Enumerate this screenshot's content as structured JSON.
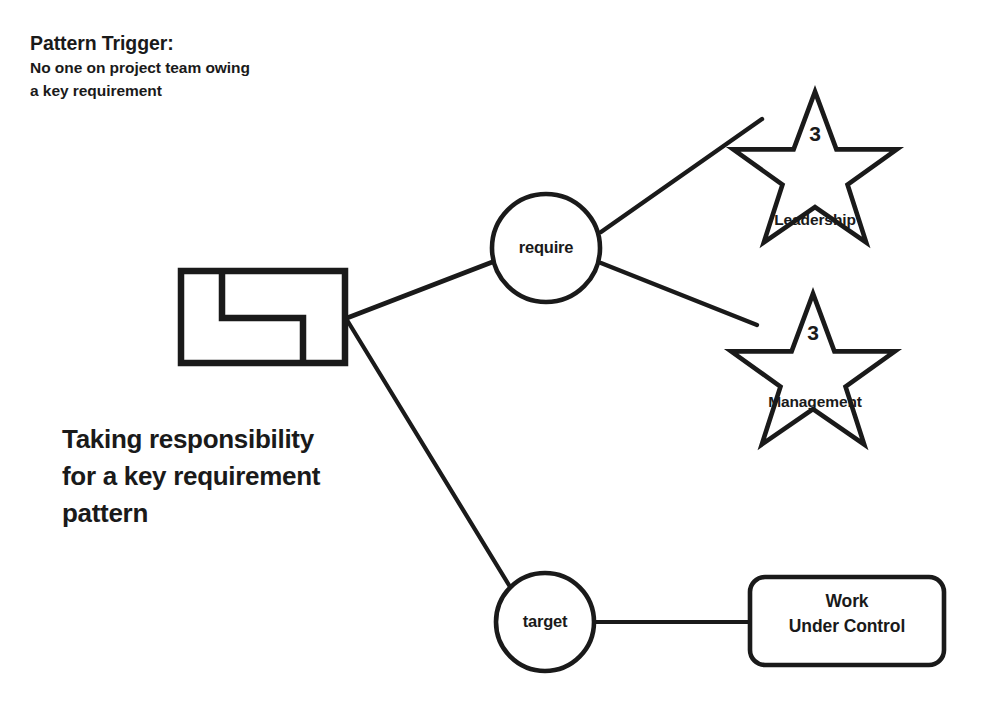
{
  "diagram": {
    "trigger": {
      "title": "Pattern Trigger:",
      "line1": "No one on project team owing",
      "line2": "a key requirement"
    },
    "caption": {
      "line1": "Taking responsibility",
      "line2": "for a key requirement",
      "line3": "pattern"
    },
    "nodes": {
      "pattern_icon": {
        "name": "pattern-icon",
        "shape": "rectangle-with-z-path"
      },
      "require": {
        "label": "require",
        "shape": "circle"
      },
      "target": {
        "label": "target",
        "shape": "circle"
      },
      "leadership": {
        "count": "3",
        "label": "Leadership",
        "shape": "star"
      },
      "management": {
        "count": "3",
        "label": "Management",
        "shape": "star"
      },
      "work_under_control": {
        "line1": "Work",
        "line2": "Under Control",
        "shape": "rounded-rectangle"
      }
    },
    "edges": [
      {
        "from": "pattern-icon",
        "to": "require"
      },
      {
        "from": "pattern-icon",
        "to": "target"
      },
      {
        "from": "require",
        "to": "leadership"
      },
      {
        "from": "require",
        "to": "management"
      },
      {
        "from": "target",
        "to": "work-under-control"
      }
    ],
    "colors": {
      "stroke": "#1a1a1a",
      "background": "#ffffff",
      "text": "#1a1a1a"
    }
  }
}
